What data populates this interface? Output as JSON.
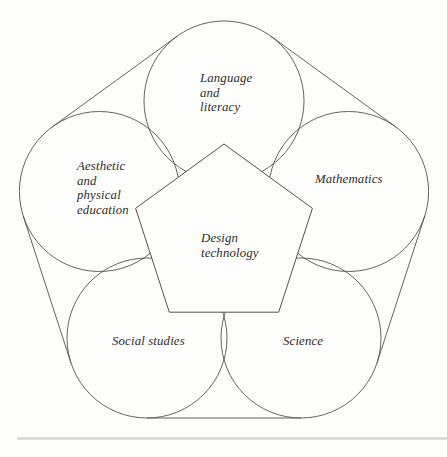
{
  "figure": {
    "width": 447,
    "height": 457,
    "background_color": "#fdfdfc",
    "line_color": "#55524d",
    "text_color": "#2f2d2a",
    "label_line_height": 14.5,
    "circles": [
      {
        "name": "language-and-literacy",
        "cx": 224,
        "cy": 101,
        "r": 80,
        "label": {
          "lines": [
            "Language",
            "and",
            "literacy"
          ],
          "x": 200,
          "y": 82
        }
      },
      {
        "name": "mathematics",
        "cx": 348.6,
        "cy": 191.5,
        "r": 80,
        "label": {
          "lines": [
            "Mathematics"
          ],
          "x": 315,
          "y": 183
        }
      },
      {
        "name": "science",
        "cx": 301,
        "cy": 338,
        "r": 80,
        "label": {
          "lines": [
            "Science"
          ],
          "x": 283,
          "y": 345
        }
      },
      {
        "name": "social-studies",
        "cx": 147,
        "cy": 338,
        "r": 80,
        "label": {
          "lines": [
            "Social studies"
          ],
          "x": 112,
          "y": 345
        }
      },
      {
        "name": "aesthetic-and-physical-education",
        "cx": 99.4,
        "cy": 191.5,
        "r": 80,
        "label": {
          "lines": [
            "Aesthetic",
            "and",
            "physical",
            "education"
          ],
          "x": 77,
          "y": 170
        }
      }
    ],
    "pentagon": {
      "name": "design-technology",
      "points": "224,144 312.4,208.3 278.7,312.2 169.3,312.2 135.6,208.3",
      "fill_color": "#fdfdfc",
      "label": {
        "lines": [
          "Design",
          "technology"
        ],
        "x": 201,
        "y": 242
      }
    },
    "outer_tangent_lines": [
      {
        "x1": 177.0,
        "y1": 36.3,
        "x2": 52.4,
        "y2": 126.8
      },
      {
        "x1": 23.3,
        "y1": 216.2,
        "x2": 70.9,
        "y2": 362.7
      },
      {
        "x1": 147.0,
        "y1": 418.0,
        "x2": 301.0,
        "y2": 418.0
      },
      {
        "x1": 377.1,
        "y1": 362.7,
        "x2": 424.7,
        "y2": 216.2
      },
      {
        "x1": 395.6,
        "y1": 126.8,
        "x2": 271.0,
        "y2": 36.3
      }
    ],
    "bottom_rule": {
      "x1": 18,
      "y1": 438.5,
      "x2": 447,
      "y2": 438.5,
      "color": "#d6d4d0"
    }
  }
}
